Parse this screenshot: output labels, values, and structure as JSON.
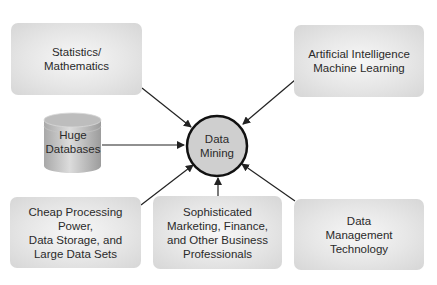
{
  "diagram": {
    "type": "hub-and-spoke",
    "center": {
      "id": "data-mining",
      "lines": [
        "Data",
        "Mining"
      ]
    },
    "nodes": [
      {
        "id": "statistics",
        "shape": "rounded-box",
        "lines": [
          "Statistics/",
          "Mathematics"
        ]
      },
      {
        "id": "ai-ml",
        "shape": "rounded-box",
        "lines": [
          "Artificial Intelligence",
          "Machine Learning"
        ]
      },
      {
        "id": "huge-databases",
        "shape": "cylinder",
        "lines": [
          "Huge",
          "Databases"
        ]
      },
      {
        "id": "cheap-processing",
        "shape": "rounded-box",
        "lines": [
          "Cheap Processing Power,",
          "Data Storage, and",
          "Large Data Sets"
        ]
      },
      {
        "id": "sophisticated-professionals",
        "shape": "rounded-box",
        "lines": [
          "Sophisticated",
          "Marketing, Finance,",
          "and Other Business",
          "Professionals"
        ]
      },
      {
        "id": "data-management",
        "shape": "rounded-box",
        "lines": [
          "Data",
          "Management",
          "Technology"
        ]
      }
    ],
    "edges": [
      {
        "from": "statistics",
        "to": "data-mining"
      },
      {
        "from": "ai-ml",
        "to": "data-mining"
      },
      {
        "from": "huge-databases",
        "to": "data-mining"
      },
      {
        "from": "cheap-processing",
        "to": "data-mining"
      },
      {
        "from": "sophisticated-professionals",
        "to": "data-mining"
      },
      {
        "from": "data-management",
        "to": "data-mining"
      }
    ],
    "colors": {
      "box_fill": "#e2e2e2",
      "circle_fill": "#d0d0d0",
      "circle_stroke": "#111111",
      "arrow": "#222222",
      "text": "#2a2a2a"
    }
  }
}
